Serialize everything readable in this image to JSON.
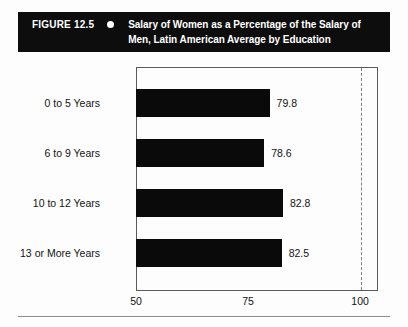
{
  "figure": {
    "number_label": "FIGURE 12.5",
    "bullet_icon": "filled-circle-icon",
    "title_line_1": "Salary of Women as a Percentage of the Salary of",
    "title_line_2": "Men, Latin American Average by Education",
    "title_full": "Salary of Women as a Percentage of the Salary of Men, Latin American Average by Education",
    "caption_background": "#0d0d0d",
    "caption_text_color": "#ffffff"
  },
  "chart_data": {
    "type": "bar",
    "orientation": "horizontal",
    "title": "Salary of Women as a Percentage of the Salary of Men, Latin American Average by Education",
    "xlabel": "",
    "ylabel": "",
    "categories": [
      "0 to 5 Years",
      "6 to 9 Years",
      "10 to 12 Years",
      "13 or More Years"
    ],
    "values": [
      79.8,
      78.6,
      82.8,
      82.5
    ],
    "value_labels": [
      "79.8",
      "78.6",
      "82.8",
      "82.5"
    ],
    "xlim": [
      50,
      104
    ],
    "xticks": [
      50,
      75,
      100
    ],
    "xtick_labels": [
      "50",
      "75",
      "100"
    ],
    "grid": false,
    "legend": null,
    "bar_color": "#0a0a0a",
    "reference_line": {
      "value": 100,
      "style": "dashed",
      "color": "#7d7d7d"
    },
    "axis_color": "#5b5b5b"
  }
}
